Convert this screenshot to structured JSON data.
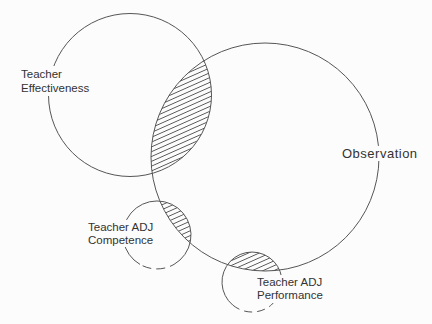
{
  "diagram": {
    "type": "venn-diagram",
    "colors": {
      "line": "#565656",
      "text": "#333333",
      "background": "#fcfcfc"
    },
    "overlap_fill_style": "diagonal-hatch",
    "sets": [
      {
        "id": "teacher-effectiveness",
        "label": "Teacher Effectiveness",
        "label_lines": [
          "Teacher",
          "Effectiveness"
        ]
      },
      {
        "id": "observation",
        "label": "Observation",
        "label_lines": [
          "Observation"
        ]
      },
      {
        "id": "teacher-adj-competence",
        "label": "Teacher ADJ Competence",
        "label_lines": [
          "Teacher ADJ",
          "Competence"
        ]
      },
      {
        "id": "teacher-adj-performance",
        "label": "Teacher ADJ Performance",
        "label_lines": [
          "Teacher ADJ",
          "Performance"
        ]
      }
    ],
    "overlaps": [
      {
        "sets": [
          "Teacher Effectiveness",
          "Observation"
        ],
        "fill": "hatched"
      },
      {
        "sets": [
          "Teacher ADJ Competence",
          "Observation"
        ],
        "fill": "hatched"
      },
      {
        "sets": [
          "Teacher ADJ Performance",
          "Observation"
        ],
        "fill": "hatched"
      }
    ]
  }
}
